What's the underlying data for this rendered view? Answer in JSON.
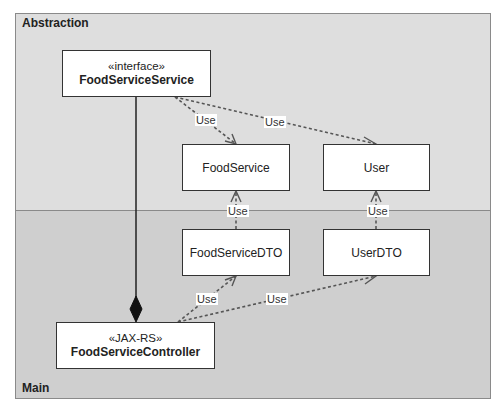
{
  "packages": [
    {
      "id": "abstraction",
      "label": "Abstraction",
      "fill": "#dedede"
    },
    {
      "id": "main",
      "label": "Main",
      "fill": "#cfcfcf"
    }
  ],
  "classes": {
    "food_service_service": {
      "stereotype": "«interface»",
      "name": "FoodServiceService",
      "package": "Abstraction"
    },
    "food_service": {
      "name": "FoodService",
      "package": "Abstraction"
    },
    "user": {
      "name": "User",
      "package": "Abstraction"
    },
    "food_service_dto": {
      "name": "FoodServiceDTO",
      "package": "Main"
    },
    "user_dto": {
      "name": "UserDTO",
      "package": "Main"
    },
    "food_service_controller": {
      "stereotype": "«JAX-RS»",
      "name": "FoodServiceController",
      "package": "Main"
    }
  },
  "relations": [
    {
      "from": "FoodServiceService",
      "to": "FoodService",
      "type": "dependency",
      "label": "Use"
    },
    {
      "from": "FoodServiceService",
      "to": "User",
      "type": "dependency",
      "label": "Use"
    },
    {
      "from": "FoodServiceDTO",
      "to": "FoodService",
      "type": "dependency",
      "label": "Use"
    },
    {
      "from": "UserDTO",
      "to": "User",
      "type": "dependency",
      "label": "Use"
    },
    {
      "from": "FoodServiceController",
      "to": "FoodServiceDTO",
      "type": "dependency",
      "label": "Use"
    },
    {
      "from": "FoodServiceController",
      "to": "UserDTO",
      "type": "dependency",
      "label": "Use"
    },
    {
      "from": "FoodServiceController",
      "to": "FoodServiceService",
      "type": "composition",
      "label": ""
    }
  ],
  "edge_labels": {
    "fss_fs": "Use",
    "fss_user": "Use",
    "fsdto_fs": "Use",
    "userdto_user": "Use",
    "fsc_fsdto": "Use",
    "fsc_userdto": "Use"
  }
}
